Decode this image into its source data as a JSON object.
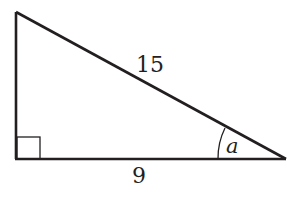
{
  "diagram": {
    "type": "right-triangle",
    "hypotenuse_label": "15",
    "base_label": "9",
    "angle_label": "a",
    "right_angle_marker": true,
    "stroke_color": "#231f20",
    "background": "#ffffff"
  }
}
